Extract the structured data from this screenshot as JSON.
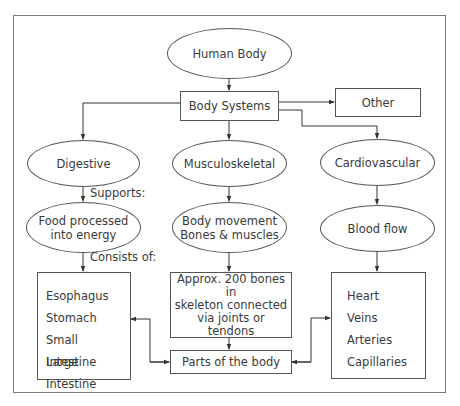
{
  "diagram": {
    "root": "Human Body",
    "systems_hub": "Body Systems",
    "other": "Other",
    "systems": [
      {
        "name": "Digestive",
        "function": "Food processed into energy",
        "function_lines": [
          "Food processed",
          "into energy"
        ]
      },
      {
        "name": "Musculoskeletal",
        "function": "Body movement Bones & muscles",
        "function_lines": [
          "Body movement",
          "Bones & muscles"
        ]
      },
      {
        "name": "Cardiovascular",
        "function": "Blood flow",
        "function_lines": [
          "Blood flow"
        ]
      }
    ],
    "edge_labels": {
      "supports": "Supports:",
      "consists_of": "Consists of:"
    },
    "digestive_parts": [
      "Esophagus",
      "Stomach",
      "Small Intestine",
      "Large Intestine"
    ],
    "skeleton_note_lines": [
      "Approx. 200 bones in",
      "skeleton connected",
      "via joints or",
      "tendons"
    ],
    "cardiovascular_parts": [
      "Heart",
      "Veins",
      "Arteries",
      "Capillaries"
    ],
    "parts_hub": "Parts of the body"
  }
}
